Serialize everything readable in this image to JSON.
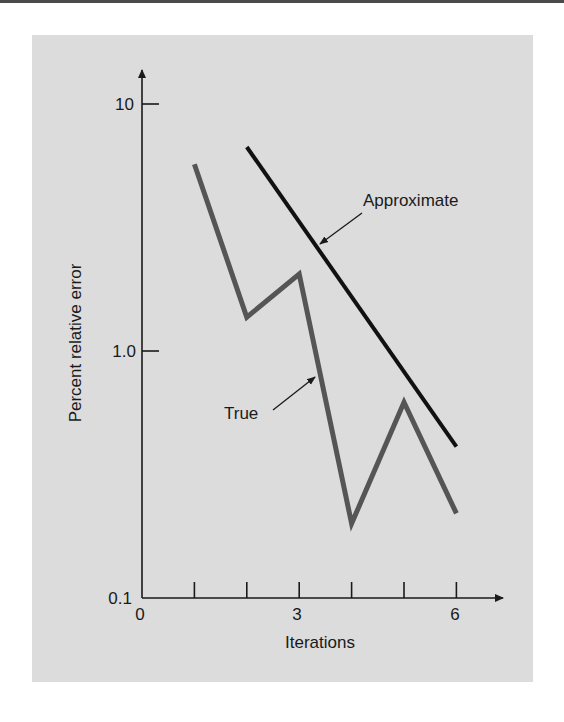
{
  "chart_data": {
    "type": "line",
    "title": "",
    "xlabel": "Iterations",
    "ylabel": "Percent relative error",
    "yscale": "log",
    "xlim": [
      0,
      6
    ],
    "ylim": [
      0.1,
      10
    ],
    "x_ticks": [
      1,
      2,
      3,
      4,
      5,
      6
    ],
    "x_tick_labels": [
      {
        "x": 0,
        "label": "0"
      },
      {
        "x": 3,
        "label": "3"
      },
      {
        "x": 6,
        "label": "6"
      }
    ],
    "y_ticks": [
      {
        "y": 0.1,
        "label": "0.1"
      },
      {
        "y": 1.0,
        "label": "1.0"
      },
      {
        "y": 10,
        "label": "10"
      }
    ],
    "grid": false,
    "legend": "none (inline annotations with arrows)",
    "series": [
      {
        "name": "True",
        "color": "#555555",
        "x": [
          1,
          2,
          3,
          4,
          5,
          6
        ],
        "values": [
          5.7,
          1.37,
          2.05,
          0.2,
          0.62,
          0.22
        ]
      },
      {
        "name": "Approximate",
        "color": "#111111",
        "x": [
          2,
          6
        ],
        "values": [
          6.7,
          0.41
        ]
      }
    ],
    "annotations": [
      {
        "text": "Approximate",
        "points_to_series": "Approximate"
      },
      {
        "text": "True",
        "points_to_series": "True"
      }
    ]
  },
  "labels": {
    "xlabel": "Iterations",
    "ylabel": "Percent relative error",
    "annot_approx": "Approximate",
    "annot_true": "True",
    "y10": "10",
    "y1": "1.0",
    "y01": "0.1",
    "x0": "0",
    "x3": "3",
    "x6": "6"
  },
  "colors": {
    "panel": "#dcdcdc",
    "axis": "#1a1a1a",
    "true_line": "#555555",
    "approx_line": "#111111"
  }
}
